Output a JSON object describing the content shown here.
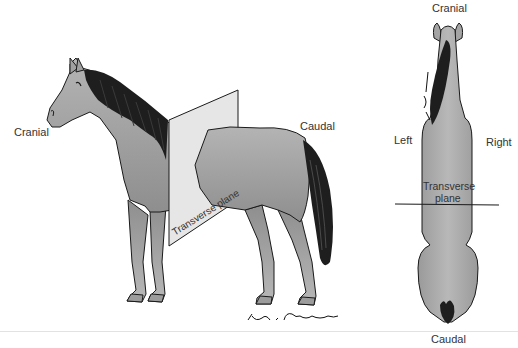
{
  "figure": {
    "side_view": {
      "labels": {
        "cranial": "Cranial",
        "caudal": "Caudal",
        "plane": "Transverse plane"
      }
    },
    "top_view": {
      "labels": {
        "cranial": "Cranial",
        "caudal": "Caudal",
        "left": "Left",
        "right": "Right",
        "plane_line1": "Transverse",
        "plane_line2": "plane"
      }
    },
    "signature": "Dan I. Christensen",
    "colors": {
      "body_fill": "#a8a8a8",
      "body_shade": "#8a8a8a",
      "plane_fill": "#e6e6e6",
      "mane": "#1e1e1e",
      "outline": "#1a1a1a",
      "text": "#333333"
    }
  }
}
